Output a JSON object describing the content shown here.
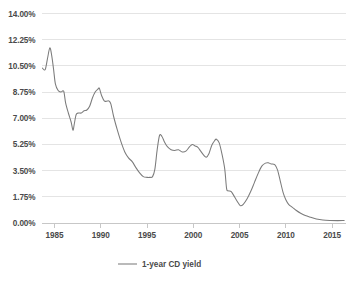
{
  "chart_data": {
    "type": "line",
    "title": "",
    "subtitle": "",
    "xlabel": "",
    "ylabel": "",
    "grid": true,
    "legend_position": "bottom-center",
    "xlim": [
      1983.6,
      2016.5
    ],
    "ylim": [
      0.0,
      14.0
    ],
    "y_ticks": [
      0.0,
      1.75,
      3.5,
      5.25,
      7.0,
      8.75,
      10.5,
      12.25,
      14.0
    ],
    "y_tick_labels": [
      "0.00%",
      "1.75%",
      "3.50%",
      "5.25%",
      "7.00%",
      "8.75%",
      "10.50%",
      "12.25%",
      "14.00%"
    ],
    "x_ticks": [
      1985,
      1990,
      1995,
      2000,
      2005,
      2010,
      2015
    ],
    "x_tick_labels": [
      "1985",
      "1990",
      "1995",
      "2000",
      "2005",
      "2010",
      "2015"
    ],
    "series": [
      {
        "name": "1-year CD yield",
        "color": "#7b7b7b",
        "x": [
          1983.7,
          1984.0,
          1984.25,
          1984.5,
          1984.7,
          1984.9,
          1985.1,
          1985.4,
          1985.7,
          1986.0,
          1986.2,
          1986.5,
          1986.8,
          1987.0,
          1987.15,
          1987.35,
          1987.6,
          1987.9,
          1988.2,
          1988.5,
          1988.8,
          1989.1,
          1989.4,
          1989.7,
          1989.85,
          1990.1,
          1990.4,
          1990.7,
          1990.9,
          1991.1,
          1991.4,
          1991.8,
          1992.2,
          1992.6,
          1993.0,
          1993.4,
          1993.8,
          1994.2,
          1994.6,
          1995.0,
          1995.3,
          1995.6,
          1995.85,
          1996.1,
          1996.35,
          1996.6,
          1996.9,
          1997.2,
          1997.6,
          1998.0,
          1998.4,
          1998.8,
          1999.2,
          1999.6,
          1999.9,
          2000.2,
          2000.5,
          2000.8,
          2001.1,
          2001.4,
          2001.7,
          2002.0,
          2002.3,
          2002.5,
          2002.8,
          2003.1,
          2003.4,
          2003.6,
          2003.8,
          2004.1,
          2004.5,
          2004.9,
          2005.1,
          2005.4,
          2005.8,
          2006.2,
          2006.6,
          2007.0,
          2007.4,
          2007.8,
          2008.1,
          2008.4,
          2008.8,
          2009.1,
          2009.4,
          2009.7,
          2010.0,
          2010.3,
          2010.7,
          2011.1,
          2011.6,
          2012.1,
          2012.7,
          2013.3,
          2014.0,
          2014.8,
          2015.6,
          2016.3
        ],
        "y": [
          10.35,
          10.25,
          11.0,
          11.7,
          11.2,
          10.3,
          9.3,
          8.85,
          8.75,
          8.8,
          8.05,
          7.35,
          6.75,
          6.2,
          6.65,
          7.25,
          7.35,
          7.35,
          7.5,
          7.55,
          7.8,
          8.35,
          8.75,
          8.95,
          9.0,
          8.5,
          8.15,
          8.15,
          8.15,
          7.95,
          7.1,
          6.2,
          5.4,
          4.75,
          4.35,
          4.1,
          3.7,
          3.35,
          3.1,
          3.05,
          3.05,
          3.1,
          3.6,
          4.9,
          5.85,
          5.8,
          5.4,
          5.1,
          4.9,
          4.85,
          4.9,
          4.75,
          4.8,
          5.1,
          5.25,
          5.15,
          5.05,
          4.8,
          4.55,
          4.4,
          4.65,
          5.2,
          5.5,
          5.6,
          5.35,
          4.6,
          3.6,
          2.3,
          2.15,
          2.1,
          1.7,
          1.3,
          1.15,
          1.25,
          1.6,
          2.1,
          2.7,
          3.3,
          3.8,
          4.0,
          4.02,
          3.95,
          3.9,
          3.55,
          2.8,
          2.05,
          1.55,
          1.25,
          1.05,
          0.85,
          0.65,
          0.5,
          0.38,
          0.27,
          0.2,
          0.17,
          0.16,
          0.17
        ]
      }
    ]
  },
  "legend": {
    "entries": [
      {
        "label": "1-year CD yield"
      }
    ]
  },
  "axes": {
    "y_labels": [
      "14.00%",
      "12.25%",
      "10.50%",
      "8.75%",
      "7.00%",
      "5.25%",
      "3.50%",
      "1.75%",
      "0.00%"
    ],
    "x_labels": [
      "1985",
      "1990",
      "1995",
      "2000",
      "2005",
      "2010",
      "2015"
    ]
  }
}
